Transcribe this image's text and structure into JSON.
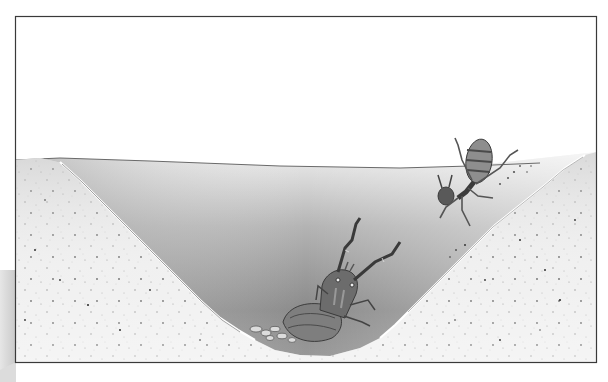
{
  "illustration": {
    "subject": "antlion pit with ant",
    "elements": [
      {
        "name": "frame",
        "desc": "thin dark rectangular border"
      },
      {
        "name": "sky",
        "desc": "white background above sand"
      },
      {
        "name": "sand-pit",
        "desc": "V-shaped conical pit in speckled sand"
      },
      {
        "name": "ant",
        "desc": "ant tumbling down the right slope of the pit"
      },
      {
        "name": "antlion",
        "desc": "antlion larva with raised mandibles at bottom of pit"
      },
      {
        "name": "pebbles",
        "desc": "small stones around the antlion at pit bottom"
      }
    ]
  },
  "colors": {
    "frame": "#3a3a3a",
    "sky": "#ffffff",
    "sand": "#efefef",
    "speckle": "#555555",
    "pit_dark": "#8a8a8a",
    "pit_light": "#e8e8e8",
    "insect_dark": "#4a4a4a",
    "insect_mid": "#8c8c8c"
  }
}
